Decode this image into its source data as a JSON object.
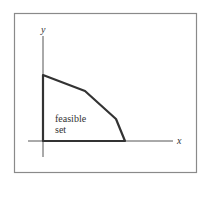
{
  "diagram": {
    "type": "feasible-set-plot",
    "axes": {
      "x_label": "x",
      "y_label": "y"
    },
    "region_label_line1": "feasible",
    "region_label_line2": "set",
    "vertices": [
      [
        0,
        0
      ],
      [
        0,
        66
      ],
      [
        42,
        50
      ],
      [
        73,
        22
      ],
      [
        82,
        0
      ]
    ],
    "colors": {
      "frame": "#8a8a8a",
      "axis": "#555555",
      "boundary": "#333333"
    }
  }
}
